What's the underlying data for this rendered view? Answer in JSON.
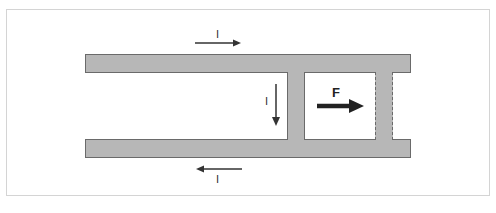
{
  "diagram": {
    "type": "rail-gun / sliding conductor on parallel rails",
    "colors": {
      "conductor_fill": "#b7b7b7",
      "conductor_border": "#6a6a6a",
      "arrow": "#333333",
      "frame_border": "#d4d4d4",
      "background": "#ffffff"
    },
    "labels": {
      "current_top": "I",
      "current_rod": "I",
      "current_bottom": "I",
      "force": "F"
    },
    "elements": [
      {
        "name": "top-rail",
        "description": "upper conducting rail"
      },
      {
        "name": "bottom-rail",
        "description": "lower conducting rail"
      },
      {
        "name": "sliding-rod",
        "description": "solid conducting rod across rails"
      },
      {
        "name": "rod-displaced-position",
        "description": "dashed outline showing rod's later position"
      }
    ],
    "arrows": [
      {
        "name": "current-top-arrow",
        "direction": "right",
        "label": "I"
      },
      {
        "name": "current-rod-arrow",
        "direction": "down",
        "label": "I"
      },
      {
        "name": "current-bottom-arrow",
        "direction": "left",
        "label": "I"
      },
      {
        "name": "force-arrow",
        "direction": "right",
        "label": "F"
      }
    ]
  }
}
